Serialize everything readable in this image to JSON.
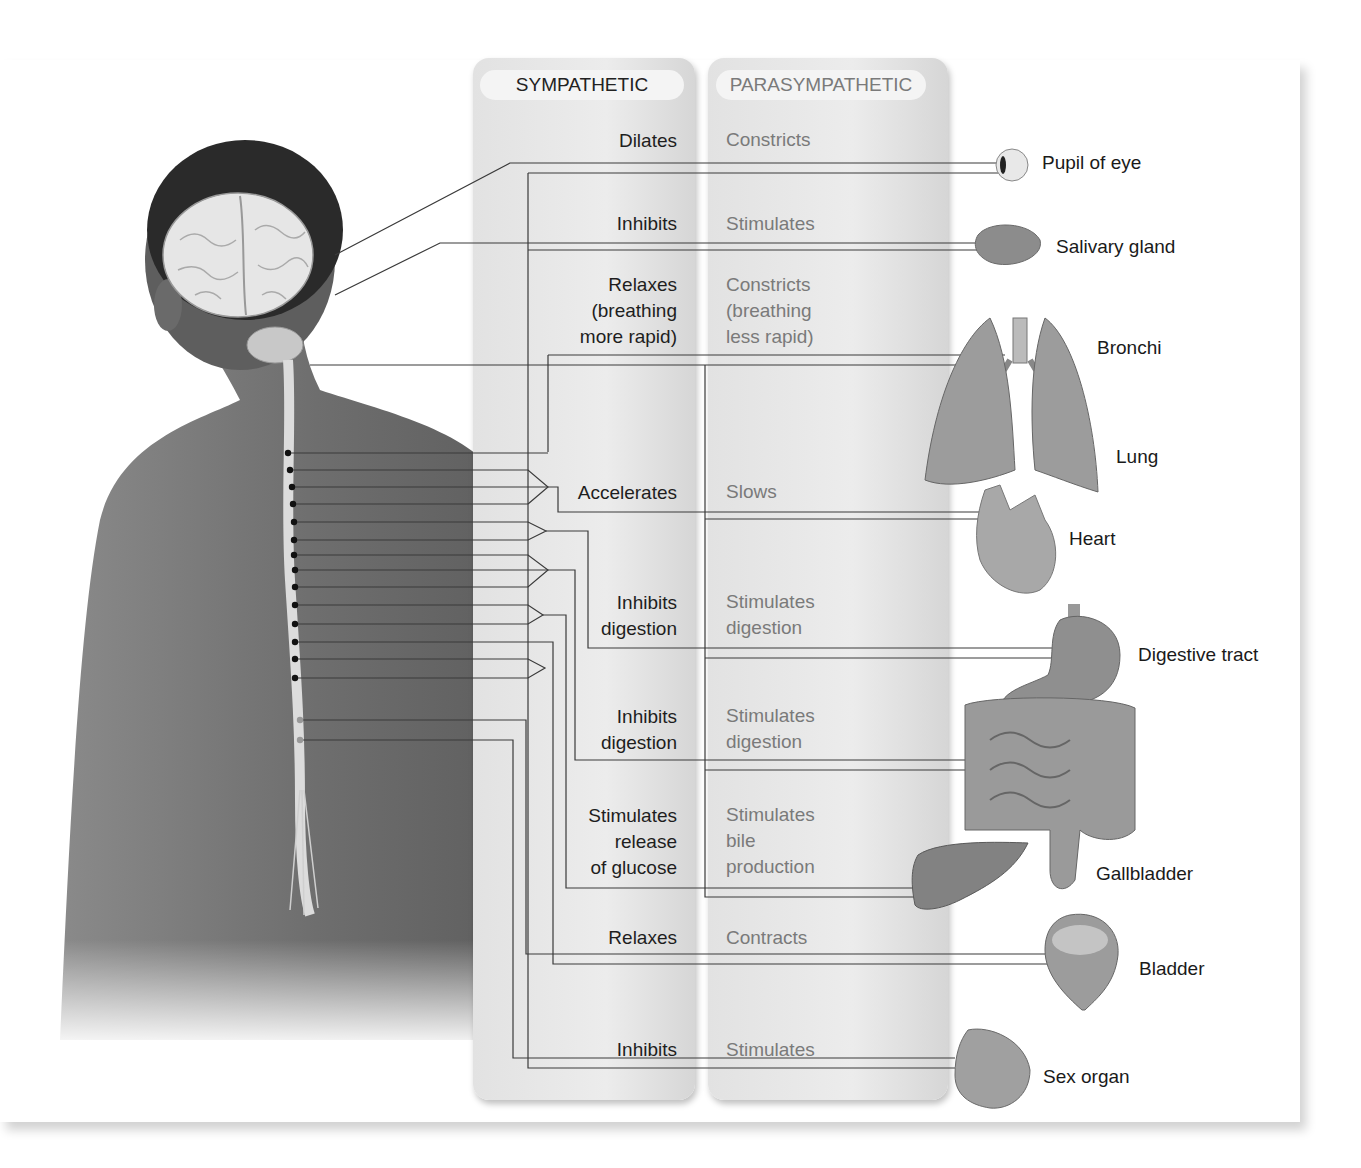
{
  "columns": {
    "sympathetic": "SYMPATHETIC",
    "parasympathetic": "PARASYMPATHETIC"
  },
  "rows": [
    {
      "organ": "Pupil of eye",
      "sympathetic": "Dilates",
      "parasympathetic": "Constricts"
    },
    {
      "organ": "Salivary gland",
      "sympathetic": "Inhibits",
      "parasympathetic": "Stimulates"
    },
    {
      "organ": "Bronchi",
      "sympathetic": "Relaxes\n(breathing\nmore rapid)",
      "parasympathetic": "Constricts\n(breathing\nless rapid)"
    },
    {
      "organ": "Heart",
      "sympathetic": "Accelerates",
      "parasympathetic": "Slows"
    },
    {
      "organ": "Digestive tract",
      "sympathetic": "Inhibits\ndigestion",
      "parasympathetic": "Stimulates\ndigestion"
    },
    {
      "organ": "Digestive tract (intestines)",
      "sympathetic": "Inhibits\ndigestion",
      "parasympathetic": "Stimulates\ndigestion"
    },
    {
      "organ": "Gallbladder",
      "sympathetic": "Stimulates\nrelease\nof glucose",
      "parasympathetic": "Stimulates\nbile\nproduction"
    },
    {
      "organ": "Bladder",
      "sympathetic": "Relaxes",
      "parasympathetic": "Contracts"
    },
    {
      "organ": "Sex organ",
      "sympathetic": "Inhibits",
      "parasympathetic": "Stimulates"
    }
  ],
  "organ_labels": {
    "pupil": "Pupil of eye",
    "salivary": "Salivary gland",
    "bronchi": "Bronchi",
    "lung": "Lung",
    "heart": "Heart",
    "digestive": "Digestive tract",
    "gallbladder": "Gallbladder",
    "bladder": "Bladder",
    "sex_organ": "Sex organ"
  },
  "colors": {
    "panel": "#e4e4e4",
    "sympathetic_text": "#1e1e1e",
    "parasympathetic_text": "#7a7a7a",
    "body": "#6a6a6a",
    "lines": "#333333"
  }
}
